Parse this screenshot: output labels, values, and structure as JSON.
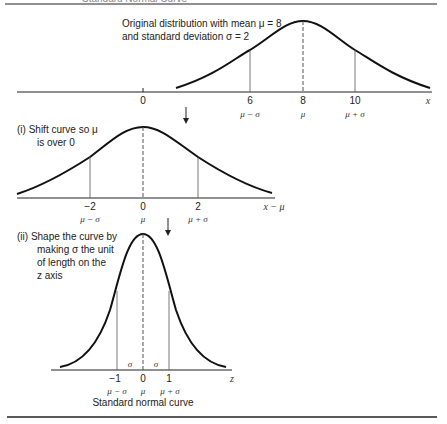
{
  "header": {
    "cut_title": "Standard Normal Curve"
  },
  "panel_original": {
    "caption_line1": "Original distribution with mean μ = 8",
    "caption_line2": "and standard deviation σ = 2",
    "ticks": [
      "0",
      "6",
      "8",
      "10"
    ],
    "tick_labels": [
      "μ − σ",
      "μ",
      "μ + σ"
    ],
    "axis_name": "x"
  },
  "panel_shift": {
    "caption_line1": "(i)  Shift curve so μ",
    "caption_line2": "is over 0",
    "ticks": [
      "−2",
      "0",
      "2"
    ],
    "tick_labels": [
      "μ − σ",
      "μ",
      "μ + σ"
    ],
    "axis_name": "x − μ"
  },
  "panel_standard": {
    "caption_line1": "(ii)  Shape the curve by",
    "caption_line2": "making σ the  unit",
    "caption_line3": "of length on the",
    "caption_line4": "z axis",
    "sigma_marks": [
      "σ",
      "σ"
    ],
    "ticks": [
      "−1",
      "0",
      "1"
    ],
    "tick_labels": [
      "μ − σ",
      "μ",
      "μ + σ"
    ],
    "axis_name": "z",
    "footer": "Standard normal curve"
  },
  "colors": {
    "line": "#111111",
    "thin": "#555555"
  }
}
